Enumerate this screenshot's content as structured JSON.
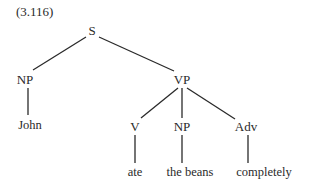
{
  "example_number": "(3.116)",
  "tree": {
    "nodes": {
      "S": {
        "label": "S",
        "x": 92,
        "y": 24
      },
      "NP_subj": {
        "label": "NP",
        "x": 25,
        "y": 73
      },
      "VP": {
        "label": "VP",
        "x": 182,
        "y": 73
      },
      "V": {
        "label": "V",
        "x": 135,
        "y": 120
      },
      "NP_obj": {
        "label": "NP",
        "x": 182,
        "y": 120
      },
      "Adv": {
        "label": "Adv",
        "x": 246,
        "y": 120
      }
    },
    "leaves": {
      "John": {
        "label": "John",
        "x": 30,
        "y": 119
      },
      "ate": {
        "label": "ate",
        "x": 135,
        "y": 166
      },
      "the_beans": {
        "label": "the beans",
        "x": 190,
        "y": 166
      },
      "completely": {
        "label": "completely",
        "x": 264,
        "y": 166
      }
    },
    "edges": [
      {
        "from": "S",
        "to": "NP_subj"
      },
      {
        "from": "S",
        "to": "VP"
      },
      {
        "from": "NP_subj",
        "to": "John"
      },
      {
        "from": "VP",
        "to": "V"
      },
      {
        "from": "VP",
        "to": "NP_obj"
      },
      {
        "from": "VP",
        "to": "Adv"
      },
      {
        "from": "V",
        "to": "ate"
      },
      {
        "from": "NP_obj",
        "to": "the beans"
      },
      {
        "from": "Adv",
        "to": "completely"
      }
    ],
    "colors": {
      "ink": "#2a2a2a",
      "background": "#ffffff"
    }
  }
}
